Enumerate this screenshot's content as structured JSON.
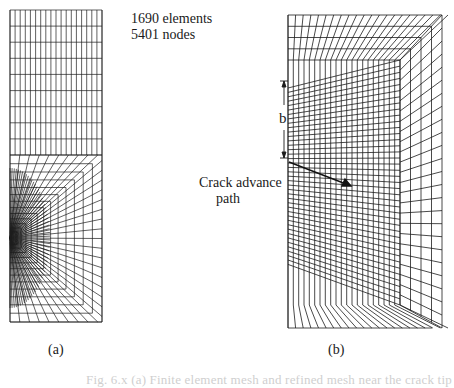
{
  "figure": {
    "panel_a": {
      "label": "(a)",
      "stats": {
        "elements": "1690 elements",
        "nodes": "5401 nodes"
      },
      "mesh": {
        "left": 10,
        "right": 102,
        "top": 10,
        "bottom": 322,
        "coarse_bottom": 155,
        "columns": 18,
        "coarse_rows": 9,
        "refine_rings": 7,
        "focus_x": 10,
        "focus_y": 238
      }
    },
    "panel_b": {
      "label": "(b)",
      "annotation_dimension": "b",
      "annotation_crack": [
        "Crack advance",
        "path"
      ],
      "mesh": {
        "left": 288,
        "right": 442,
        "top": 15,
        "bottom": 328,
        "inner_right": 400,
        "inner_top": 60,
        "inner_bottom": 305,
        "columns": 21,
        "rows": 40,
        "focus_x": 288,
        "focus_y": 160
      }
    },
    "caption": "Fig. 6.x (a) Finite element mesh and refined mesh near the crack tip"
  },
  "colors": {
    "line": "#1c1c1c",
    "background": "#ffffff",
    "caption": "#cfcfcf"
  }
}
